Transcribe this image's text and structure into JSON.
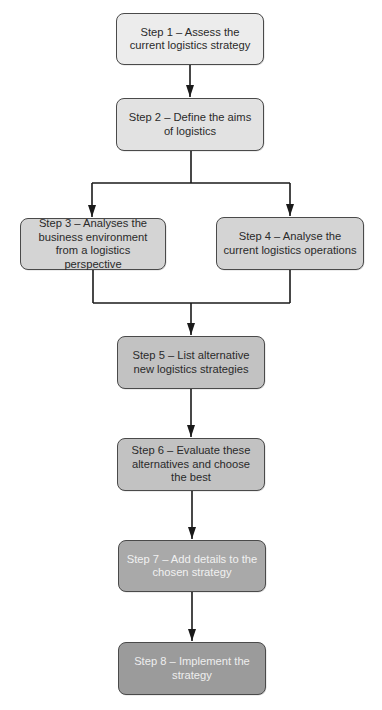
{
  "diagram": {
    "type": "flowchart",
    "steps": [
      {
        "id": "step1",
        "label": "Step 1 – Assess the current logistics strategy",
        "fill": "#ececec",
        "text_color": "#2a2a2a"
      },
      {
        "id": "step2",
        "label": "Step 2 – Define the aims of logistics",
        "fill": "#e2e2e2",
        "text_color": "#2a2a2a"
      },
      {
        "id": "step3",
        "label": "Step 3 – Analyses the business environment from a logistics perspective",
        "fill": "#d4d4d4",
        "text_color": "#2a2a2a"
      },
      {
        "id": "step4",
        "label": "Step 4 – Analyse the current logistics operations",
        "fill": "#d4d4d4",
        "text_color": "#2a2a2a"
      },
      {
        "id": "step5",
        "label": "Step 5 – List alternative new logistics strategies",
        "fill": "#c2c2c2",
        "text_color": "#2a2a2a"
      },
      {
        "id": "step6",
        "label": "Step 6 – Evaluate these alternatives and choose the best",
        "fill": "#c2c2c2",
        "text_color": "#2a2a2a"
      },
      {
        "id": "step7",
        "label": "Step 7 – Add details to the chosen strategy",
        "fill": "#a9a9a9",
        "text_color": "#f1f1f1"
      },
      {
        "id": "step8",
        "label": "Step 8 – Implement the strategy",
        "fill": "#9b9b9b",
        "text_color": "#eeeeee"
      }
    ],
    "edges": [
      {
        "from": "step1",
        "to": "step2"
      },
      {
        "from": "step2",
        "to": "step3"
      },
      {
        "from": "step2",
        "to": "step4"
      },
      {
        "from": "step3",
        "to": "step5"
      },
      {
        "from": "step4",
        "to": "step5"
      },
      {
        "from": "step5",
        "to": "step6"
      },
      {
        "from": "step6",
        "to": "step7"
      },
      {
        "from": "step7",
        "to": "step8"
      }
    ],
    "colors": {
      "line": "#1a1a1a",
      "border": "#4a4a4a",
      "background": "#ffffff"
    }
  }
}
